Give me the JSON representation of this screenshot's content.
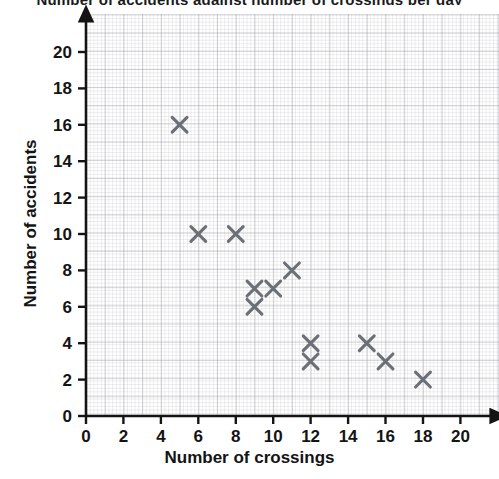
{
  "title_fragment": "Number of accidents against number of crossings per day",
  "axes": {
    "x_title": "Number of crossings",
    "y_title": "Number of accidents",
    "x_ticks": [
      "0",
      "2",
      "4",
      "6",
      "8",
      "10",
      "12",
      "14",
      "16",
      "18",
      "20"
    ],
    "y_ticks": [
      "0",
      "2",
      "4",
      "6",
      "8",
      "10",
      "12",
      "14",
      "16",
      "18",
      "20"
    ]
  },
  "colors": {
    "marker": "#6b6f76",
    "axis": "#141414",
    "grid_major": "#96989e",
    "grid_minor": "#aaacb2",
    "background": "#ffffff"
  },
  "chart_data": {
    "type": "scatter",
    "title": "",
    "xlabel": "Number of crossings",
    "ylabel": "Number of accidents",
    "xlim": [
      0,
      21.8
    ],
    "ylim": [
      0,
      22
    ],
    "xticks": [
      0,
      2,
      4,
      6,
      8,
      10,
      12,
      14,
      16,
      18,
      20
    ],
    "yticks": [
      0,
      2,
      4,
      6,
      8,
      10,
      12,
      14,
      16,
      18,
      20
    ],
    "grid": true,
    "minor_grid": true,
    "legend": null,
    "marker": "x",
    "marker_color": "#6b6f76",
    "points": [
      {
        "x": 5,
        "y": 16
      },
      {
        "x": 6,
        "y": 10
      },
      {
        "x": 8,
        "y": 10
      },
      {
        "x": 9,
        "y": 7
      },
      {
        "x": 9,
        "y": 6
      },
      {
        "x": 10,
        "y": 7
      },
      {
        "x": 11,
        "y": 8
      },
      {
        "x": 12,
        "y": 4
      },
      {
        "x": 12,
        "y": 3
      },
      {
        "x": 15,
        "y": 4
      },
      {
        "x": 16,
        "y": 3
      },
      {
        "x": 18,
        "y": 2
      }
    ]
  }
}
